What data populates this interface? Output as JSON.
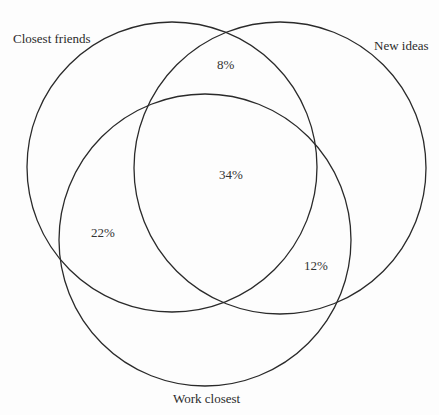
{
  "diagram": {
    "type": "venn",
    "sets": [
      {
        "id": "closest_friends",
        "label": "Closest friends",
        "cx": 172,
        "cy": 167,
        "r": 145
      },
      {
        "id": "new_ideas",
        "label": "New ideas",
        "cx": 280,
        "cy": 168,
        "r": 146
      },
      {
        "id": "work_closest",
        "label": "Work closest",
        "cx": 205,
        "cy": 240,
        "r": 146
      }
    ],
    "regions": [
      {
        "sets": [
          "closest_friends",
          "new_ideas"
        ],
        "value": "8%"
      },
      {
        "sets": [
          "closest_friends",
          "new_ideas",
          "work_closest"
        ],
        "value": "34%"
      },
      {
        "sets": [
          "closest_friends",
          "work_closest"
        ],
        "value": "22%"
      },
      {
        "sets": [
          "new_ideas",
          "work_closest"
        ],
        "value": "12%"
      }
    ],
    "stroke_color": "#2a2a2a",
    "background": "#fdfdfd"
  }
}
